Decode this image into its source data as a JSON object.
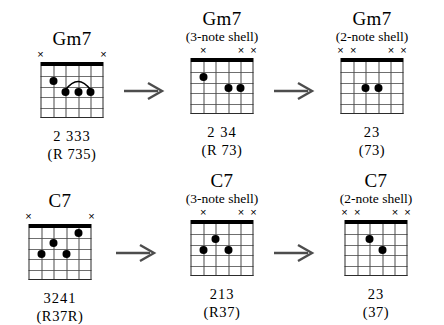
{
  "diagram_title": "Gm7 and C7 shell voicing reduction",
  "strings_count": 6,
  "frets_count": 5,
  "arrow_label": "becomes",
  "rows": [
    {
      "id": "gm7-row",
      "chords": [
        {
          "id": "gm7-full",
          "title": "Gm7",
          "subtitle": "",
          "fingering": "2 333",
          "intervals": "(R 735)",
          "markers": [
            "x",
            "",
            "",
            "",
            "",
            "x"
          ],
          "dots": [
            {
              "string": 5,
              "fret": 2
            },
            {
              "string": 4,
              "fret": 3
            },
            {
              "string": 3,
              "fret": 3
            },
            {
              "string": 2,
              "fret": 3
            }
          ],
          "barre": {
            "from_string": 4,
            "to_string": 2,
            "fret": 3
          }
        },
        {
          "id": "gm7-3note",
          "title": "Gm7",
          "subtitle": "(3-note shell)",
          "fingering": "2 34",
          "intervals": "(R  73)",
          "markers": [
            "",
            "x",
            "",
            "",
            "x",
            "x"
          ],
          "dots": [
            {
              "string": 5,
              "fret": 2
            },
            {
              "string": 3,
              "fret": 3
            },
            {
              "string": 2,
              "fret": 3
            }
          ],
          "barre": null
        },
        {
          "id": "gm7-2note",
          "title": "Gm7",
          "subtitle": "(2-note shell)",
          "fingering": "23",
          "intervals": "(73)",
          "markers": [
            "x",
            "x",
            "",
            "",
            "x",
            "x"
          ],
          "dots": [
            {
              "string": 4,
              "fret": 3
            },
            {
              "string": 3,
              "fret": 3
            }
          ],
          "barre": null
        }
      ]
    },
    {
      "id": "c7-row",
      "chords": [
        {
          "id": "c7-full",
          "title": "C7",
          "subtitle": "",
          "fingering": "3241",
          "intervals": "(R37R)",
          "markers": [
            "x",
            "",
            "",
            "",
            "",
            "x"
          ],
          "dots": [
            {
              "string": 5,
              "fret": 3
            },
            {
              "string": 4,
              "fret": 2
            },
            {
              "string": 3,
              "fret": 3
            },
            {
              "string": 2,
              "fret": 1
            }
          ],
          "barre": null
        },
        {
          "id": "c7-3note",
          "title": "C7",
          "subtitle": "(3-note shell)",
          "fingering": "213",
          "intervals": "(R37)",
          "markers": [
            "",
            "x",
            "",
            "",
            "x",
            "x"
          ],
          "dots": [
            {
              "string": 5,
              "fret": 3
            },
            {
              "string": 4,
              "fret": 2
            },
            {
              "string": 3,
              "fret": 3
            }
          ],
          "barre": null
        },
        {
          "id": "c7-2note",
          "title": "C7",
          "subtitle": "(2-note shell)",
          "fingering": "23",
          "intervals": "(37)",
          "markers": [
            "x",
            "x",
            "",
            "",
            "x",
            "x"
          ],
          "dots": [
            {
              "string": 4,
              "fret": 2
            },
            {
              "string": 3,
              "fret": 3
            }
          ],
          "barre": null
        }
      ]
    }
  ]
}
